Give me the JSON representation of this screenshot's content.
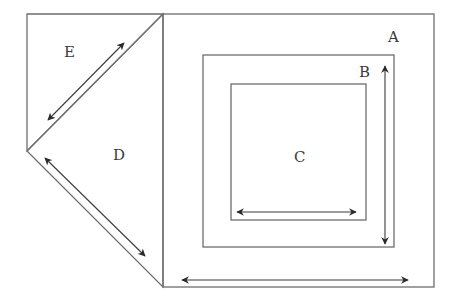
{
  "diagram": {
    "title": "",
    "regions": [
      {
        "id": "A",
        "label": "A",
        "shape": "square"
      },
      {
        "id": "B",
        "label": "B",
        "shape": "square"
      },
      {
        "id": "C",
        "label": "C",
        "shape": "square"
      },
      {
        "id": "D",
        "label": "D",
        "shape": "triangle"
      },
      {
        "id": "E",
        "label": "E",
        "shape": "triangle"
      }
    ],
    "dimension_arrows": [
      {
        "id": "arrow-a",
        "for": "A",
        "direction": "horizontal",
        "double_headed": true
      },
      {
        "id": "arrow-b",
        "for": "B",
        "direction": "vertical",
        "double_headed": true
      },
      {
        "id": "arrow-c",
        "for": "C",
        "direction": "horizontal",
        "double_headed": true
      },
      {
        "id": "arrow-d",
        "for": "D",
        "direction": "diagonal",
        "double_headed": true
      },
      {
        "id": "arrow-e",
        "for": "E",
        "direction": "diagonal",
        "double_headed": true
      }
    ],
    "colors": {
      "edge": "#6e6e6e",
      "arrow": "#3a3a3a",
      "label": "#3a3a3a",
      "background": "#ffffff"
    }
  }
}
